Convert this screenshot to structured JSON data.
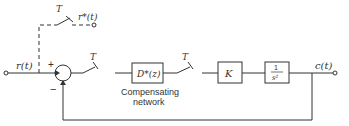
{
  "diagram": {
    "type": "sampled-data feedback control block diagram",
    "input_label": "r(t)",
    "sampled_input_label": "r*(t)",
    "output_label": "c(t)",
    "sampler_period_label": "T",
    "summing_junction": {
      "plus": "+",
      "minus": "−"
    },
    "blocks": [
      {
        "id": "compensator",
        "label": "D*(z)",
        "caption_line1": "Compensating",
        "caption_line2": "network"
      },
      {
        "id": "gain",
        "label": "K"
      },
      {
        "id": "plant",
        "numerator": "1",
        "denominator": "s²"
      }
    ],
    "samplers": [
      {
        "id": "sampler-input-dashed",
        "label": "T"
      },
      {
        "id": "sampler-error",
        "label": "T"
      },
      {
        "id": "sampler-after-compensator",
        "label": "T"
      }
    ],
    "colors": {
      "line": "#333333",
      "background": "#ffffff"
    }
  }
}
